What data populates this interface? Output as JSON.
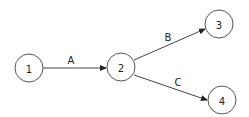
{
  "diagram": {
    "type": "directed-graph",
    "nodes": [
      {
        "id": "1",
        "label": "1",
        "cx": 29,
        "cy": 68,
        "r": 14
      },
      {
        "id": "2",
        "label": "2",
        "cx": 121,
        "cy": 67,
        "r": 14
      },
      {
        "id": "3",
        "label": "3",
        "cx": 219,
        "cy": 24,
        "r": 14
      },
      {
        "id": "4",
        "label": "4",
        "cx": 222,
        "cy": 100,
        "r": 14
      }
    ],
    "edges": [
      {
        "id": "A",
        "label": "A",
        "from": "1",
        "to": "2",
        "x1": 43,
        "y1": 68,
        "x2": 106,
        "y2": 68,
        "lx": 71,
        "ly": 60
      },
      {
        "id": "B",
        "label": "B",
        "from": "2",
        "to": "3",
        "x1": 134,
        "y1": 60,
        "x2": 205,
        "y2": 29,
        "lx": 168,
        "ly": 37
      },
      {
        "id": "C",
        "label": "C",
        "from": "2",
        "to": "4",
        "x1": 134,
        "y1": 75,
        "x2": 207,
        "y2": 100,
        "lx": 178,
        "ly": 82
      }
    ],
    "colors": {
      "stroke": "#444444",
      "text": "#222222",
      "background": "#ffffff"
    }
  }
}
